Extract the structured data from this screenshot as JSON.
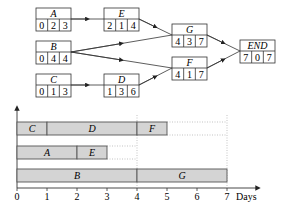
{
  "network": {
    "nodes": [
      {
        "id": "A",
        "label": "A",
        "values": [
          "0",
          "2",
          "3"
        ],
        "x": 36,
        "y": 8
      },
      {
        "id": "B",
        "label": "B",
        "values": [
          "0",
          "4",
          "4"
        ],
        "x": 36,
        "y": 41
      },
      {
        "id": "C",
        "label": "C",
        "values": [
          "0",
          "1",
          "3"
        ],
        "x": 36,
        "y": 74
      },
      {
        "id": "E",
        "label": "E",
        "values": [
          "2",
          "1",
          "4"
        ],
        "x": 104,
        "y": 8
      },
      {
        "id": "D",
        "label": "D",
        "values": [
          "1",
          "3",
          "6"
        ],
        "x": 104,
        "y": 74
      },
      {
        "id": "G",
        "label": "G",
        "values": [
          "4",
          "3",
          "7"
        ],
        "x": 172,
        "y": 24
      },
      {
        "id": "F",
        "label": "F",
        "values": [
          "4",
          "1",
          "7"
        ],
        "x": 172,
        "y": 57
      },
      {
        "id": "END",
        "label": "END",
        "values": [
          "7",
          "0",
          "7"
        ],
        "x": 240,
        "y": 40
      }
    ],
    "edges": [
      [
        "A",
        "E"
      ],
      [
        "C",
        "D"
      ],
      [
        "E",
        "G"
      ],
      [
        "B",
        "G"
      ],
      [
        "B",
        "F"
      ],
      [
        "D",
        "F"
      ],
      [
        "G",
        "END"
      ],
      [
        "F",
        "END"
      ]
    ]
  },
  "gantt": {
    "x_axis_label": "Days",
    "ticks": [
      "0",
      "1",
      "2",
      "3",
      "4",
      "5",
      "6",
      "7"
    ],
    "rows": [
      {
        "bars": [
          {
            "label": "C",
            "start": 0,
            "end": 1
          },
          {
            "label": "D",
            "start": 1,
            "end": 4
          },
          {
            "label": "F",
            "start": 4,
            "end": 5
          }
        ],
        "float_end": 7
      },
      {
        "bars": [
          {
            "label": "A",
            "start": 0,
            "end": 2
          },
          {
            "label": "E",
            "start": 2,
            "end": 3
          }
        ],
        "float_end": 4
      },
      {
        "bars": [
          {
            "label": "B",
            "start": 0,
            "end": 4
          },
          {
            "label": "G",
            "start": 4,
            "end": 7
          }
        ],
        "float_end": null
      }
    ],
    "colors": {
      "bar_fill": "#d4d4d4",
      "bar_stroke": "#555555",
      "dotted": "#aaaaaa"
    }
  }
}
